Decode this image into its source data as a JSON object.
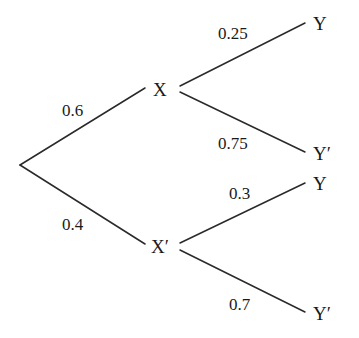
{
  "diagram": {
    "type": "probability-tree",
    "root": {
      "branches": [
        {
          "node": "X",
          "probability": "0.6",
          "branches": [
            {
              "node": "Y",
              "probability": "0.25"
            },
            {
              "node": "Y′",
              "probability": "0.75"
            }
          ]
        },
        {
          "node": "X′",
          "probability": "0.4",
          "branches": [
            {
              "node": "Y",
              "probability": "0.3"
            },
            {
              "node": "Y′",
              "probability": "0.7"
            }
          ]
        }
      ]
    },
    "colors": {
      "line": "#2a2a2a",
      "text": "#1a1a1a",
      "background": "#ffffff"
    }
  }
}
